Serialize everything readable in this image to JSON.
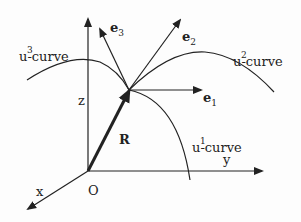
{
  "diagram": {
    "type": "curvilinear-coordinate-basis",
    "colors": {
      "ink": "#222222",
      "background": "#fdfdfd"
    },
    "axes": {
      "x": {
        "label": "x"
      },
      "y": {
        "label": "y"
      },
      "z": {
        "label": "z"
      },
      "origin": {
        "label": "O"
      }
    },
    "position_vector": {
      "label": "R"
    },
    "basis_vectors": [
      {
        "symbol": "e",
        "index": "1"
      },
      {
        "symbol": "e",
        "index": "2"
      },
      {
        "symbol": "e",
        "index": "3"
      }
    ],
    "curves": [
      {
        "base": "u",
        "superscript": "1",
        "suffix": "-curve"
      },
      {
        "base": "u",
        "superscript": "2",
        "suffix": "-curve"
      },
      {
        "base": "u",
        "superscript": "3",
        "suffix": "-curve"
      }
    ]
  }
}
